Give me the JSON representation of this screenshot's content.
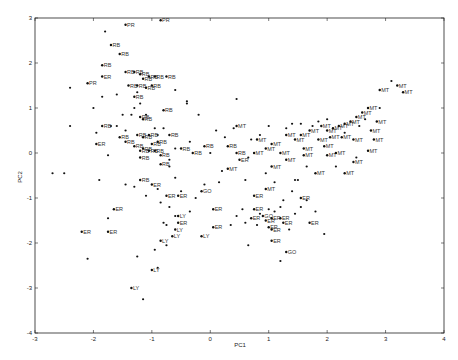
{
  "chart_data": {
    "type": "scatter",
    "title": "",
    "xlabel": "PC1",
    "ylabel": "PC2",
    "xlim": [
      -3,
      4
    ],
    "ylim": [
      -4,
      3
    ],
    "xticks": [
      -3,
      -2,
      -1,
      0,
      1,
      2,
      3,
      4
    ],
    "yticks": [
      -4,
      -3,
      -2,
      -1,
      0,
      1,
      2,
      3
    ],
    "grid": false,
    "legend": null,
    "marker": "*",
    "groups": [
      "RB",
      "MT",
      "ER",
      "GO",
      "LY",
      "PR"
    ],
    "labeled_points": [
      {
        "x": -0.85,
        "y": 2.95,
        "label": "PR"
      },
      {
        "x": -1.45,
        "y": 2.85,
        "label": "PR"
      },
      {
        "x": -1.7,
        "y": 2.4,
        "label": "RB"
      },
      {
        "x": -1.55,
        "y": 2.2,
        "label": "RB"
      },
      {
        "x": -1.85,
        "y": 1.95,
        "label": "RB"
      },
      {
        "x": -1.85,
        "y": 1.7,
        "label": "ER"
      },
      {
        "x": -2.1,
        "y": 1.55,
        "label": "PR"
      },
      {
        "x": -1.45,
        "y": 1.8,
        "label": "RB"
      },
      {
        "x": -1.3,
        "y": 1.8,
        "label": "RB"
      },
      {
        "x": -1.2,
        "y": 1.75,
        "label": "RB"
      },
      {
        "x": -1.15,
        "y": 1.65,
        "label": "RB"
      },
      {
        "x": -1.05,
        "y": 1.7,
        "label": "RB"
      },
      {
        "x": -0.95,
        "y": 1.7,
        "label": "RB"
      },
      {
        "x": -0.75,
        "y": 1.7,
        "label": "RB"
      },
      {
        "x": -1.4,
        "y": 1.5,
        "label": "RB"
      },
      {
        "x": -1.25,
        "y": 1.5,
        "label": "RB"
      },
      {
        "x": -1.1,
        "y": 1.45,
        "label": "RB"
      },
      {
        "x": -1.0,
        "y": 1.5,
        "label": "RB"
      },
      {
        "x": -1.3,
        "y": 1.25,
        "label": "RB"
      },
      {
        "x": -0.8,
        "y": 0.95,
        "label": "RB"
      },
      {
        "x": -1.2,
        "y": 0.8,
        "label": "RB"
      },
      {
        "x": -1.15,
        "y": 0.75,
        "label": "RB"
      },
      {
        "x": -1.85,
        "y": 0.6,
        "label": "RB"
      },
      {
        "x": -1.55,
        "y": 0.35,
        "label": "RB"
      },
      {
        "x": -1.45,
        "y": 0.25,
        "label": "RB"
      },
      {
        "x": -1.25,
        "y": 0.4,
        "label": "RB"
      },
      {
        "x": -1.15,
        "y": 0.35,
        "label": "RB"
      },
      {
        "x": -1.05,
        "y": 0.4,
        "label": "RB"
      },
      {
        "x": -1.3,
        "y": 0.15,
        "label": "RB"
      },
      {
        "x": -1.15,
        "y": 0.1,
        "label": "RB"
      },
      {
        "x": -1.0,
        "y": 0.2,
        "label": "RB"
      },
      {
        "x": -0.9,
        "y": 0.25,
        "label": "RB"
      },
      {
        "x": -1.2,
        "y": 0.05,
        "label": "RB"
      },
      {
        "x": -1.05,
        "y": 0.05,
        "label": "RB"
      },
      {
        "x": -0.95,
        "y": 0.05,
        "label": "RB"
      },
      {
        "x": -0.85,
        "y": -0.05,
        "label": "RB"
      },
      {
        "x": -1.2,
        "y": -0.1,
        "label": "RB"
      },
      {
        "x": -0.85,
        "y": -0.25,
        "label": "RB"
      },
      {
        "x": -0.7,
        "y": 0.4,
        "label": "RB"
      },
      {
        "x": -0.5,
        "y": 0.1,
        "label": "RB"
      },
      {
        "x": -0.3,
        "y": 0.0,
        "label": "RB"
      },
      {
        "x": -0.1,
        "y": 0.15,
        "label": "RB"
      },
      {
        "x": 0.45,
        "y": 0.0,
        "label": "RB"
      },
      {
        "x": 0.3,
        "y": 0.15,
        "label": "RB"
      },
      {
        "x": -1.95,
        "y": 0.2,
        "label": "ER"
      },
      {
        "x": -1.2,
        "y": -0.6,
        "label": "RB"
      },
      {
        "x": -1.0,
        "y": -0.7,
        "label": "ER"
      },
      {
        "x": -0.75,
        "y": -0.95,
        "label": "ER"
      },
      {
        "x": -0.55,
        "y": -0.95,
        "label": "ER"
      },
      {
        "x": -0.15,
        "y": -0.85,
        "label": "GO"
      },
      {
        "x": -0.55,
        "y": -1.4,
        "label": "LY"
      },
      {
        "x": -1.65,
        "y": -1.25,
        "label": "ER"
      },
      {
        "x": -0.6,
        "y": -1.7,
        "label": "LY"
      },
      {
        "x": -2.2,
        "y": -1.75,
        "label": "ER"
      },
      {
        "x": -1.75,
        "y": -1.75,
        "label": "ER"
      },
      {
        "x": -0.85,
        "y": -1.95,
        "label": "LY"
      },
      {
        "x": -0.65,
        "y": -1.85,
        "label": "LY"
      },
      {
        "x": -0.15,
        "y": -1.85,
        "label": "LY"
      },
      {
        "x": -1.0,
        "y": -2.6,
        "label": "LY"
      },
      {
        "x": -1.35,
        "y": -3.0,
        "label": "LY"
      },
      {
        "x": 0.05,
        "y": -1.25,
        "label": "ER"
      },
      {
        "x": -0.55,
        "y": -1.55,
        "label": "ER"
      },
      {
        "x": 0.05,
        "y": -1.65,
        "label": "ER"
      },
      {
        "x": 0.75,
        "y": -0.95,
        "label": "ER"
      },
      {
        "x": 1.55,
        "y": -1.0,
        "label": "ER"
      },
      {
        "x": 0.75,
        "y": -1.25,
        "label": "ER"
      },
      {
        "x": 0.9,
        "y": -1.4,
        "label": "GO"
      },
      {
        "x": 0.7,
        "y": -1.45,
        "label": "ER"
      },
      {
        "x": 1.05,
        "y": -1.45,
        "label": "ER"
      },
      {
        "x": 1.2,
        "y": -1.45,
        "label": "ER"
      },
      {
        "x": 1.25,
        "y": -1.55,
        "label": "ER"
      },
      {
        "x": 1.0,
        "y": -1.65,
        "label": "ER"
      },
      {
        "x": 1.7,
        "y": -1.55,
        "label": "ER"
      },
      {
        "x": 1.05,
        "y": -1.95,
        "label": "ER"
      },
      {
        "x": 1.3,
        "y": -2.2,
        "label": "GO"
      },
      {
        "x": 0.95,
        "y": -1.5,
        "label": "ER"
      },
      {
        "x": 1.05,
        "y": -1.7,
        "label": "ER"
      },
      {
        "x": 0.75,
        "y": 0.0,
        "label": "MT"
      },
      {
        "x": 0.45,
        "y": 0.6,
        "label": "MT"
      },
      {
        "x": 0.8,
        "y": 0.3,
        "label": "MT"
      },
      {
        "x": 0.95,
        "y": 0.1,
        "label": "MT"
      },
      {
        "x": 1.05,
        "y": 0.2,
        "label": "MT"
      },
      {
        "x": 1.2,
        "y": 0.0,
        "label": "MT"
      },
      {
        "x": 1.3,
        "y": 0.4,
        "label": "MT"
      },
      {
        "x": 1.45,
        "y": 0.3,
        "label": "MT"
      },
      {
        "x": 1.55,
        "y": 0.4,
        "label": "MT"
      },
      {
        "x": 1.7,
        "y": 0.5,
        "label": "MT"
      },
      {
        "x": 1.9,
        "y": 0.6,
        "label": "MT"
      },
      {
        "x": 2.0,
        "y": 0.5,
        "label": "MT"
      },
      {
        "x": 2.1,
        "y": 0.55,
        "label": "MT"
      },
      {
        "x": 2.2,
        "y": 0.6,
        "label": "MT"
      },
      {
        "x": 2.3,
        "y": 0.65,
        "label": "MT"
      },
      {
        "x": 2.4,
        "y": 0.7,
        "label": "MT"
      },
      {
        "x": 2.5,
        "y": 0.8,
        "label": "MT"
      },
      {
        "x": 2.6,
        "y": 0.9,
        "label": "MT"
      },
      {
        "x": 2.7,
        "y": 1.0,
        "label": "MT"
      },
      {
        "x": 1.85,
        "y": 0.3,
        "label": "MT"
      },
      {
        "x": 2.05,
        "y": 0.35,
        "label": "MT"
      },
      {
        "x": 2.25,
        "y": 0.35,
        "label": "MT"
      },
      {
        "x": 2.45,
        "y": 0.3,
        "label": "MT"
      },
      {
        "x": 2.8,
        "y": 0.3,
        "label": "MT"
      },
      {
        "x": 2.7,
        "y": 0.05,
        "label": "MT"
      },
      {
        "x": 1.6,
        "y": -0.05,
        "label": "MT"
      },
      {
        "x": 2.0,
        "y": -0.05,
        "label": "MT"
      },
      {
        "x": 2.15,
        "y": 0.0,
        "label": "MT"
      },
      {
        "x": 2.45,
        "y": -0.2,
        "label": "MT"
      },
      {
        "x": 1.3,
        "y": -0.15,
        "label": "MT"
      },
      {
        "x": 1.8,
        "y": -0.45,
        "label": "MT"
      },
      {
        "x": 2.3,
        "y": -0.45,
        "label": "MT"
      },
      {
        "x": 1.6,
        "y": 0.1,
        "label": "MT"
      },
      {
        "x": 1.95,
        "y": 0.15,
        "label": "MT"
      },
      {
        "x": 2.9,
        "y": 1.4,
        "label": "MT"
      },
      {
        "x": 3.2,
        "y": 1.5,
        "label": "MT"
      },
      {
        "x": 3.3,
        "y": 1.35,
        "label": "MT"
      },
      {
        "x": 0.95,
        "y": -0.8,
        "label": "MT"
      },
      {
        "x": 2.85,
        "y": 0.7,
        "label": "MT"
      },
      {
        "x": 2.75,
        "y": 0.5,
        "label": "MT"
      },
      {
        "x": 1.05,
        "y": -0.3,
        "label": "MT"
      },
      {
        "x": 0.5,
        "y": -0.15,
        "label": "ER"
      },
      {
        "x": 0.3,
        "y": -0.35,
        "label": "MT"
      }
    ],
    "unlabeled_points": [
      [
        -1.8,
        2.7
      ],
      [
        -2.4,
        1.45
      ],
      [
        -1.85,
        1.25
      ],
      [
        -1.6,
        1.3
      ],
      [
        -0.6,
        1.4
      ],
      [
        -0.4,
        1.15
      ],
      [
        -0.4,
        1.1
      ],
      [
        0.45,
        1.2
      ],
      [
        -2.0,
        1.0
      ],
      [
        -2.4,
        0.6
      ],
      [
        -1.95,
        0.45
      ],
      [
        -1.7,
        0.6
      ],
      [
        -1.75,
        -0.05
      ],
      [
        -1.25,
        1.35
      ],
      [
        -1.2,
        1.1
      ],
      [
        -1.3,
        1.0
      ],
      [
        -1.35,
        0.85
      ],
      [
        -1.1,
        0.85
      ],
      [
        -0.95,
        0.55
      ],
      [
        -0.9,
        0.4
      ],
      [
        -0.7,
        -0.3
      ],
      [
        -0.7,
        -0.15
      ],
      [
        -0.6,
        0.1
      ],
      [
        -0.8,
        0.55
      ],
      [
        -0.35,
        0.25
      ],
      [
        -0.2,
        0.85
      ],
      [
        -1.5,
        0.85
      ],
      [
        -1.6,
        0.6
      ],
      [
        -1.45,
        0.5
      ],
      [
        -2.5,
        -0.45
      ],
      [
        -2.7,
        -0.45
      ],
      [
        -1.9,
        -0.6
      ],
      [
        -1.45,
        -0.7
      ],
      [
        -1.3,
        -0.75
      ],
      [
        -1.1,
        -0.95
      ],
      [
        -0.9,
        -0.8
      ],
      [
        -0.85,
        -1.1
      ],
      [
        -0.7,
        -1.2
      ],
      [
        -0.75,
        -1.6
      ],
      [
        -0.6,
        -1.4
      ],
      [
        -1.75,
        -1.45
      ],
      [
        -0.8,
        -1.55
      ],
      [
        -0.75,
        -2.05
      ],
      [
        -0.95,
        -2.15
      ],
      [
        -1.25,
        -2.3
      ],
      [
        -0.9,
        -2.55
      ],
      [
        -1.15,
        -3.25
      ],
      [
        -2.1,
        -2.35
      ],
      [
        -0.35,
        -1.3
      ],
      [
        -0.25,
        -1.0
      ],
      [
        -0.5,
        -0.85
      ],
      [
        -0.6,
        -0.55
      ],
      [
        -0.1,
        -0.7
      ],
      [
        0.15,
        -0.65
      ],
      [
        0.2,
        -0.4
      ],
      [
        0.35,
        -1.6
      ],
      [
        0.45,
        -1.4
      ],
      [
        0.55,
        -1.25
      ],
      [
        0.6,
        -1.55
      ],
      [
        0.8,
        -1.6
      ],
      [
        0.85,
        -1.35
      ],
      [
        1.0,
        -1.25
      ],
      [
        1.1,
        -1.3
      ],
      [
        1.2,
        -1.2
      ],
      [
        1.25,
        -1.05
      ],
      [
        1.35,
        -1.7
      ],
      [
        1.45,
        -1.35
      ],
      [
        1.55,
        -1.2
      ],
      [
        1.65,
        -1.05
      ],
      [
        1.8,
        -1.3
      ],
      [
        1.95,
        -1.8
      ],
      [
        0.65,
        -2.05
      ],
      [
        1.2,
        -2.4
      ],
      [
        0.95,
        -0.45
      ],
      [
        1.1,
        -0.65
      ],
      [
        1.4,
        -0.85
      ],
      [
        1.5,
        -0.6
      ],
      [
        0.6,
        -0.6
      ],
      [
        0.4,
        0.55
      ],
      [
        0.65,
        -0.1
      ],
      [
        0.7,
        0.3
      ],
      [
        1.0,
        0.6
      ],
      [
        1.4,
        0.65
      ],
      [
        1.75,
        0.6
      ],
      [
        1.85,
        0.7
      ],
      [
        2.0,
        0.75
      ],
      [
        2.55,
        0.6
      ],
      [
        2.65,
        0.75
      ],
      [
        2.3,
        0.45
      ],
      [
        2.9,
        1.0
      ],
      [
        3.1,
        1.6
      ],
      [
        2.5,
        -0.1
      ],
      [
        2.15,
        -0.3
      ],
      [
        1.65,
        -0.3
      ],
      [
        1.45,
        -0.6
      ],
      [
        0.25,
        0.35
      ],
      [
        0.0,
        0.0
      ],
      [
        0.1,
        0.5
      ],
      [
        0.85,
        0.4
      ],
      [
        1.3,
        0.55
      ],
      [
        1.55,
        0.65
      ]
    ]
  }
}
